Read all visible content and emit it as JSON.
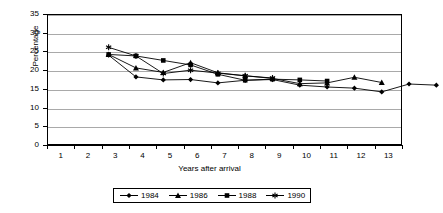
{
  "chart_data": {
    "type": "line",
    "title": "",
    "xlabel": "Years after arrival",
    "ylabel": "Percentage",
    "xlim": [
      0.5,
      13.5
    ],
    "ylim": [
      0,
      35
    ],
    "ytick_values": [
      0,
      5,
      10,
      15,
      20,
      25,
      30,
      35
    ],
    "ytick_labels": [
      "0",
      "5",
      "10",
      "15",
      "20",
      "25",
      "30",
      "35"
    ],
    "grid": "horizontal",
    "legend_position": "bottom-center",
    "x": [
      1,
      2,
      3,
      4,
      5,
      6,
      7,
      8,
      9,
      10,
      11,
      12,
      13
    ],
    "xtick_labels": [
      "1",
      "2",
      "3",
      "4",
      "5",
      "6",
      "7",
      "8",
      "9",
      "10",
      "11",
      "12",
      "13"
    ],
    "series": [
      {
        "name": "1984",
        "marker": "diamond",
        "x": [
          1,
          2,
          3,
          4,
          5,
          6,
          7,
          8,
          9,
          10,
          11,
          12,
          13
        ],
        "values": [
          28.0,
          22.2,
          21.4,
          21.5,
          20.6,
          21.3,
          21.5,
          20.0,
          19.5,
          19.2,
          18.2,
          20.3,
          20.0
        ]
      },
      {
        "name": "1986",
        "marker": "triangle",
        "x": [
          1,
          2,
          3,
          4,
          5,
          6,
          7,
          8,
          9,
          10,
          11
        ],
        "values": [
          28.2,
          24.6,
          23.4,
          26.0,
          23.3,
          22.5,
          21.8,
          20.4,
          20.6,
          22.1,
          20.7
        ]
      },
      {
        "name": "1988",
        "marker": "square",
        "x": [
          1,
          2,
          3,
          4,
          5,
          6,
          7,
          8,
          9
        ],
        "values": [
          28.2,
          27.8,
          26.6,
          25.4,
          22.9,
          21.3,
          21.6,
          21.4,
          21.1
        ]
      },
      {
        "name": "1990",
        "marker": "asterisk",
        "x": [
          1,
          2,
          3,
          4,
          5,
          6,
          7
        ],
        "values": [
          30.1,
          27.8,
          23.1,
          24.0,
          23.2,
          22.5,
          21.9
        ]
      }
    ],
    "colors": {
      "series_line": "#000000",
      "gridline": "#a9a9a9",
      "axis": "#000000",
      "background": "#ffffff"
    }
  }
}
